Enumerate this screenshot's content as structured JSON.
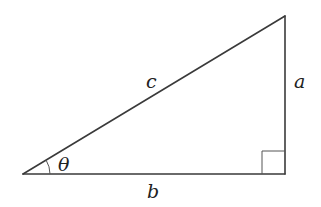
{
  "diagram": {
    "type": "right-triangle",
    "vertices": {
      "left": [
        23,
        174
      ],
      "top_right": [
        285,
        16
      ],
      "bottom_right": [
        285,
        174
      ]
    },
    "right_angle_marker": {
      "corner": "bottom_right",
      "size": 23
    },
    "angle_marker": {
      "vertex": "left",
      "radius": 27
    },
    "labels": {
      "hypotenuse": "c",
      "vertical_leg": "a",
      "horizontal_leg": "b",
      "angle": "θ"
    },
    "colors": {
      "stroke": "#3a3a3a",
      "text": "#222222",
      "background": "#ffffff"
    }
  }
}
